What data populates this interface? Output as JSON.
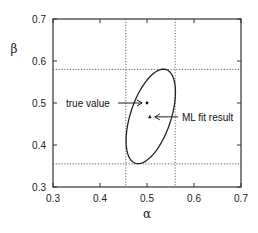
{
  "chart_data": {
    "type": "scatter",
    "title": "",
    "xlabel": "α",
    "ylabel": "β",
    "xlim": [
      0.3,
      0.7
    ],
    "ylim": [
      0.3,
      0.7
    ],
    "xticks": [
      "0.3",
      "0.4",
      "0.5",
      "0.6",
      "0.7"
    ],
    "yticks": [
      "0.3",
      "0.4",
      "0.5",
      "0.6",
      "0.7"
    ],
    "grid": false,
    "legend": null,
    "points": [
      {
        "name": "true value",
        "x": 0.5,
        "y": 0.5,
        "marker": "dot"
      },
      {
        "name": "ML fit result",
        "x": 0.506,
        "y": 0.467,
        "marker": "triangle"
      }
    ],
    "confidence_ellipse": {
      "center": [
        0.508,
        0.468
      ],
      "alpha_range": [
        0.455,
        0.56
      ],
      "beta_range": [
        0.355,
        0.58
      ],
      "top_point": [
        0.535,
        0.58
      ],
      "bottom_point": [
        0.49,
        0.355
      ]
    },
    "reference_lines": {
      "vertical_alpha": [
        0.455,
        0.56
      ],
      "horizontal_beta": [
        0.355,
        0.58
      ],
      "style": "dotted"
    },
    "annotations": [
      {
        "text": "true value",
        "target": [
          0.5,
          0.5
        ],
        "arrow": "right"
      },
      {
        "text": "ML fit result",
        "target": [
          0.506,
          0.467
        ],
        "arrow": "left"
      }
    ]
  }
}
